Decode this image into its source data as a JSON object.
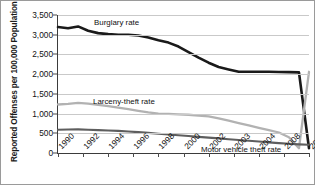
{
  "chart_data": {
    "type": "line",
    "title": "",
    "xlabel": "",
    "ylabel": "Reported Offenses per 100,000 Population",
    "ylim": [
      0,
      3500
    ],
    "yticks": [
      0,
      500,
      1000,
      1500,
      2000,
      2500,
      3000,
      3500
    ],
    "ytick_labels": [
      "0",
      "500",
      "1,000",
      "1,500",
      "2,000",
      "2,500",
      "3,000",
      "3,500"
    ],
    "grid": true,
    "legend_position": "inline-annotations",
    "x": [
      1990,
      1991,
      1992,
      1993,
      1994,
      1995,
      1996,
      1997,
      1998,
      1999,
      2000,
      2001,
      2002,
      2003,
      2004,
      2005,
      2006,
      2007,
      2008,
      2009,
      2010,
      2011,
      2012,
      2013,
      2014,
      2015
    ],
    "xtick_labels": [
      "1990",
      "1992",
      "1994",
      "1996",
      "1998",
      "2000",
      "2002",
      "2003",
      "2004",
      "2008",
      "2015"
    ],
    "series": [
      {
        "name": "Burglary rate",
        "color": "#1a1a1a",
        "values": [
          3195,
          3165,
          3210,
          3100,
          3040,
          3015,
          3000,
          3000,
          2980,
          2930,
          2860,
          2800,
          2700,
          2560,
          2420,
          2290,
          2180,
          2120,
          2060,
          2060,
          2060,
          2060,
          2055,
          2050,
          2045,
          120
        ]
      },
      {
        "name": "Larceny-theft rate",
        "color": "#b2b2b2",
        "values": [
          1230,
          1245,
          1270,
          1250,
          1220,
          1190,
          1150,
          1110,
          1070,
          1030,
          1000,
          990,
          980,
          970,
          950,
          930,
          880,
          820,
          760,
          700,
          640,
          580,
          520,
          400,
          120,
          2060
        ]
      },
      {
        "name": "Motor vehicle theft rate",
        "color": "#5e5e5e",
        "values": [
          590,
          595,
          600,
          590,
          580,
          570,
          560,
          545,
          530,
          510,
          490,
          470,
          450,
          430,
          410,
          390,
          370,
          350,
          330,
          310,
          290,
          270,
          250,
          235,
          220,
          210
        ]
      }
    ]
  }
}
